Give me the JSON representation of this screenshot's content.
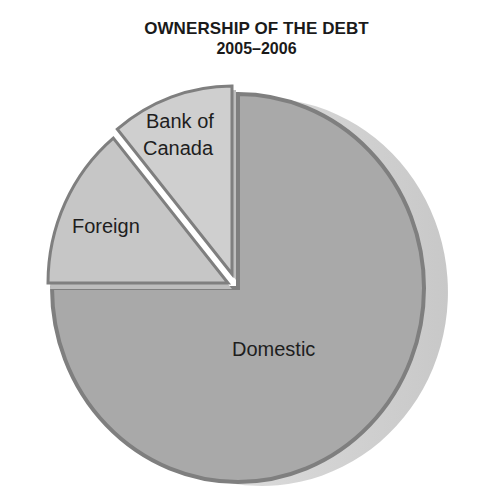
{
  "chart_data": {
    "type": "pie",
    "title": "OWNERSHIP OF THE DEBT",
    "subtitle": "2005–2006",
    "categories": [
      "Domestic",
      "Foreign",
      "Bank of Canada"
    ],
    "values": [
      75,
      14,
      11
    ],
    "unit": "percent (estimated from slice angles)",
    "exploded": [
      "Foreign",
      "Bank of Canada"
    ],
    "labels": {
      "domestic": "Domestic",
      "foreign": "Foreign",
      "bank_line1": "Bank of",
      "bank_line2": "Canada"
    },
    "colors": {
      "Domestic": "#a9a9a9",
      "Foreign": "#c6c6c6",
      "Bank of Canada": "#cfcfcf",
      "outline": "#7f7f7f",
      "depth": "#d2d2d2"
    },
    "legend": "none"
  }
}
